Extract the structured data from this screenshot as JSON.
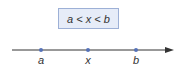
{
  "inequality": "a < x < b",
  "points": [
    {
      "label": "a"
    },
    {
      "label": "x"
    },
    {
      "label": "b"
    }
  ],
  "colors": {
    "point": "#5572b8",
    "line": "#333333",
    "box_fill": "#e6ecf8",
    "box_border": "#9db0d6"
  }
}
